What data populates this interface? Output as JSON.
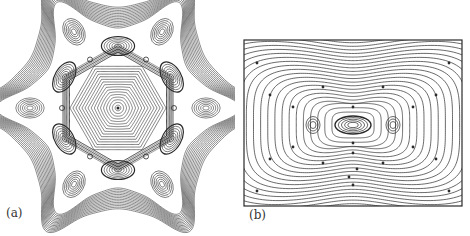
{
  "figure": {
    "panels": [
      {
        "id": "a",
        "label": "(a)",
        "description": "Contour plot with six-fold symmetric snowflake-shaped outline: central hexagonal concentric contours, ring of six inner lobes, six outer lobes at the tips",
        "center": [
          118,
          108
        ],
        "inner_lobes": 6,
        "outer_lobes": 6
      },
      {
        "id": "b",
        "label": "(b)",
        "description": "Contour plot in rectangular frame: peanut/dumbbell-shaped nested contours around a central eye-shaped vortex flanked by two small side vortices, with dots marking points along contours",
        "frame": [
          244,
          40,
          462,
          206
        ]
      }
    ],
    "line_color": "#2a2a2a",
    "background": "#ffffff"
  }
}
